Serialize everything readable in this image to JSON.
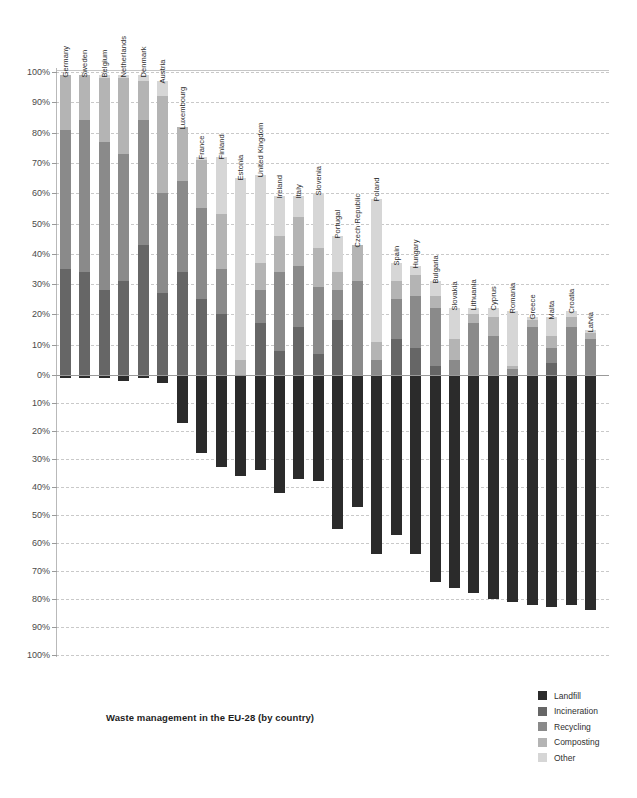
{
  "chart_title": "Waste management in the EU-28 (by country)",
  "legend": {
    "position": "bottom-right",
    "items": [
      {
        "label": "Landfill",
        "color": "#2b2b2b"
      },
      {
        "label": "Incineration",
        "color": "#666666"
      },
      {
        "label": "Recycling",
        "color": "#8a8a8a"
      },
      {
        "label": "Composting",
        "color": "#b4b4b4"
      },
      {
        "label": "Other",
        "color": "#d6d6d6"
      }
    ]
  },
  "axis": {
    "upper_ticks": [
      "100%",
      "90%",
      "80%",
      "70%",
      "60%",
      "50%",
      "40%",
      "30%",
      "20%",
      "10%",
      "0%"
    ],
    "lower_ticks": [
      "10%",
      "20%",
      "30%",
      "40%",
      "50%",
      "60%",
      "70%",
      "80%",
      "90%",
      "100%"
    ],
    "grid": true,
    "ylim_up": [
      0,
      100
    ],
    "ylim_down": [
      0,
      100
    ]
  },
  "chart_data": {
    "type": "bar",
    "title": "Waste management in the EU-28 (by country)",
    "xlabel": "",
    "ylabel": "",
    "ylim": [
      -100,
      100
    ],
    "grid": true,
    "categories": [
      "Germany",
      "Sweden",
      "Belgium",
      "Netherlands",
      "Denmark",
      "Austria",
      "Luxembourg",
      "France",
      "Finland",
      "Estonia",
      "United Kingdom",
      "Ireland",
      "Italy",
      "Slovenia",
      "Portugal",
      "Czech Republic",
      "Poland",
      "Spain",
      "Hungary",
      "Bulgaria",
      "Slovakia",
      "Lithuania",
      "Cyprus",
      "Romania",
      "Greece",
      "Malta",
      "Croatia",
      "Latvia"
    ],
    "series": [
      {
        "name": "Landfill",
        "color": "#2b2b2b",
        "direction": "down",
        "values": [
          1,
          1,
          1,
          2,
          1,
          3,
          17,
          28,
          33,
          36,
          34,
          42,
          37,
          38,
          55,
          47,
          64,
          57,
          64,
          74,
          76,
          78,
          80,
          81,
          82,
          83,
          82,
          84
        ]
      },
      {
        "name": "Incineration",
        "color": "#666666",
        "direction": "up",
        "values": [
          35,
          34,
          28,
          31,
          43,
          27,
          34,
          25,
          20,
          0,
          17,
          8,
          16,
          7,
          18,
          0,
          0,
          12,
          9,
          3,
          0,
          0,
          0,
          0,
          0,
          4,
          0,
          0
        ]
      },
      {
        "name": "Recycling",
        "color": "#8a8a8a",
        "direction": "up",
        "values": [
          46,
          50,
          49,
          42,
          41,
          33,
          30,
          30,
          15,
          0,
          11,
          26,
          20,
          22,
          10,
          31,
          5,
          13,
          17,
          19,
          5,
          17,
          13,
          2,
          16,
          5,
          16,
          12
        ]
      },
      {
        "name": "Composting",
        "color": "#b4b4b4",
        "direction": "up",
        "values": [
          18,
          15,
          21,
          25,
          13,
          32,
          18,
          16,
          18,
          5,
          9,
          12,
          16,
          13,
          6,
          12,
          6,
          6,
          7,
          4,
          7,
          3,
          6,
          1,
          2,
          4,
          3,
          2
        ]
      },
      {
        "name": "Other",
        "color": "#d6d6d6",
        "direction": "up",
        "values": [
          0,
          0,
          1,
          1,
          2,
          5,
          0,
          1,
          19,
          60,
          29,
          13,
          7,
          18,
          12,
          0,
          47,
          6,
          3,
          5,
          10,
          2,
          3,
          18,
          1,
          6,
          2,
          1
        ]
      }
    ]
  }
}
